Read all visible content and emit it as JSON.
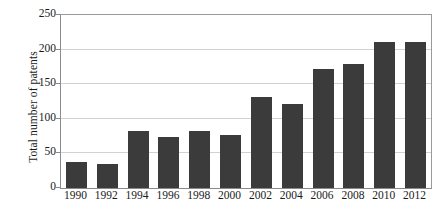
{
  "chart_data": {
    "type": "bar",
    "title": "",
    "xlabel": "",
    "ylabel": "Total number of patents",
    "categories": [
      "1990",
      "1992",
      "1994",
      "1996",
      "1998",
      "2000",
      "2002",
      "2004",
      "2006",
      "2008",
      "2010",
      "2012"
    ],
    "values": [
      38,
      35,
      83,
      74,
      83,
      76,
      131,
      121,
      172,
      179,
      211,
      211
    ],
    "ylim": [
      0,
      250
    ],
    "yticks": [
      0,
      50,
      100,
      150,
      200,
      250
    ],
    "ytick_labels": [
      "0",
      "50",
      "100",
      "150",
      "200",
      "250"
    ],
    "grid": true,
    "grid_axis": "y",
    "legend": false,
    "legend_position": "none",
    "bar_color": "#3b3b3b",
    "grid_color": "#d2d2d2",
    "axis_color": "#8a8a8a",
    "background_color": "#ffffff",
    "text_color": "#1a1a1a",
    "series": [
      {
        "name": "Total number of patents",
        "values": [
          38,
          35,
          83,
          74,
          83,
          76,
          131,
          121,
          172,
          179,
          211,
          211
        ]
      }
    ]
  }
}
